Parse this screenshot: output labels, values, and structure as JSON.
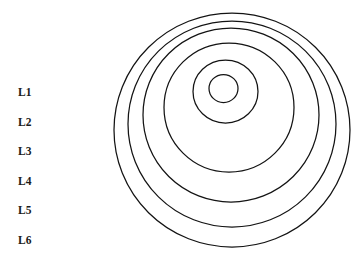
{
  "figure": {
    "type": "concentric-rings-diagram",
    "background_color": "#ffffff",
    "stroke_color": "#131313"
  },
  "legend": {
    "items": [
      {
        "label": "L1"
      },
      {
        "label": "L2"
      },
      {
        "label": "L3"
      },
      {
        "label": "L4"
      },
      {
        "label": "L5"
      },
      {
        "label": "L6"
      }
    ]
  },
  "rings": [
    {
      "name": "L1",
      "cx": 223.5,
      "cy": 88.5,
      "rx": 14.5,
      "ry": 14.0
    },
    {
      "name": "L2",
      "cx": 225.5,
      "cy": 91.5,
      "rx": 32.5,
      "ry": 31.5
    },
    {
      "name": "L3",
      "cx": 229.0,
      "cy": 107.5,
      "rx": 65.0,
      "ry": 64.5
    },
    {
      "name": "L4",
      "cx": 231.0,
      "cy": 115.0,
      "rx": 88.0,
      "ry": 87.0
    },
    {
      "name": "L5",
      "cx": 232.0,
      "cy": 124.0,
      "rx": 104.0,
      "ry": 103.0
    },
    {
      "name": "L6",
      "cx": 232.0,
      "cy": 130.0,
      "rx": 118.0,
      "ry": 117.0
    }
  ]
}
